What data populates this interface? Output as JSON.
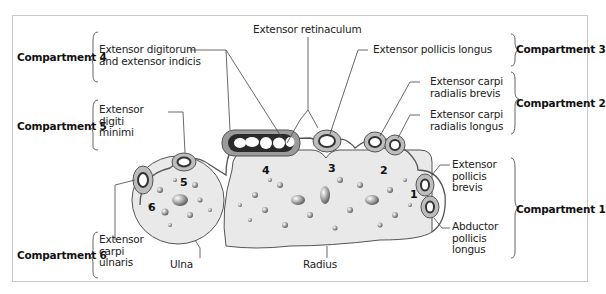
{
  "figure": {
    "compartments": [
      {
        "id": 1,
        "label": "Compartment 1",
        "muscles": [
          "Extensor pollicis brevis",
          "Abductor pollicis longus"
        ]
      },
      {
        "id": 2,
        "label": "Compartment 2",
        "muscles": [
          "Extensor carpi radialis brevis",
          "Extensor carpi radialis longus"
        ]
      },
      {
        "id": 3,
        "label": "Compartment 3",
        "muscles": [
          "Extensor pollicis longus"
        ]
      },
      {
        "id": 4,
        "label": "Compartment 4",
        "muscles": [
          "Extensor digitorum and extensor indicis"
        ]
      },
      {
        "id": 5,
        "label": "Compartment 5",
        "muscles": [
          "Extensor digiti minimi"
        ]
      },
      {
        "id": 6,
        "label": "Compartment 6",
        "muscles": [
          "Extensor carpi ulnaris"
        ]
      }
    ]
  },
  "labels": {
    "extensor_retinaculum": "Extensor retinaculum",
    "ext_digitorum": "Extensor digitorum\nand extensor indicis",
    "ext_digiti_minimi": "Extensor\ndigiti\nminimi",
    "ext_carpi_ulnaris": "Extensor\ncarpi\nulnaris",
    "ulna": "Ulna",
    "radius": "Radius",
    "ext_pollicis_longus": "Extensor pollicis longus",
    "ext_carpi_rad_brevis": "Extensor carpi\nradialis brevis",
    "ext_carpi_rad_longus": "Extensor carpi\nradialis longus",
    "ext_pollicis_brevis": "Extensor\npollicis\nbrevis",
    "abductor_pollicis_longus": "Abductor\npollicis\nlongus"
  },
  "compartment_labels": {
    "c1": "Compartment 1",
    "c2": "Compartment 2",
    "c3": "Compartment 3",
    "c4": "Compartment 4",
    "c5": "Compartment 5",
    "c6": "Compartment 6"
  },
  "numbers": {
    "n1": "1",
    "n2": "2",
    "n3": "3",
    "n4": "4",
    "n5": "5",
    "n6": "6"
  },
  "colors": {
    "bone": "#e9e9e9",
    "tendon_sheath": "#9a9a9a",
    "tendon_dark": "#2a2a2a",
    "outline": "#555555",
    "frame": "#c8c8c8"
  }
}
